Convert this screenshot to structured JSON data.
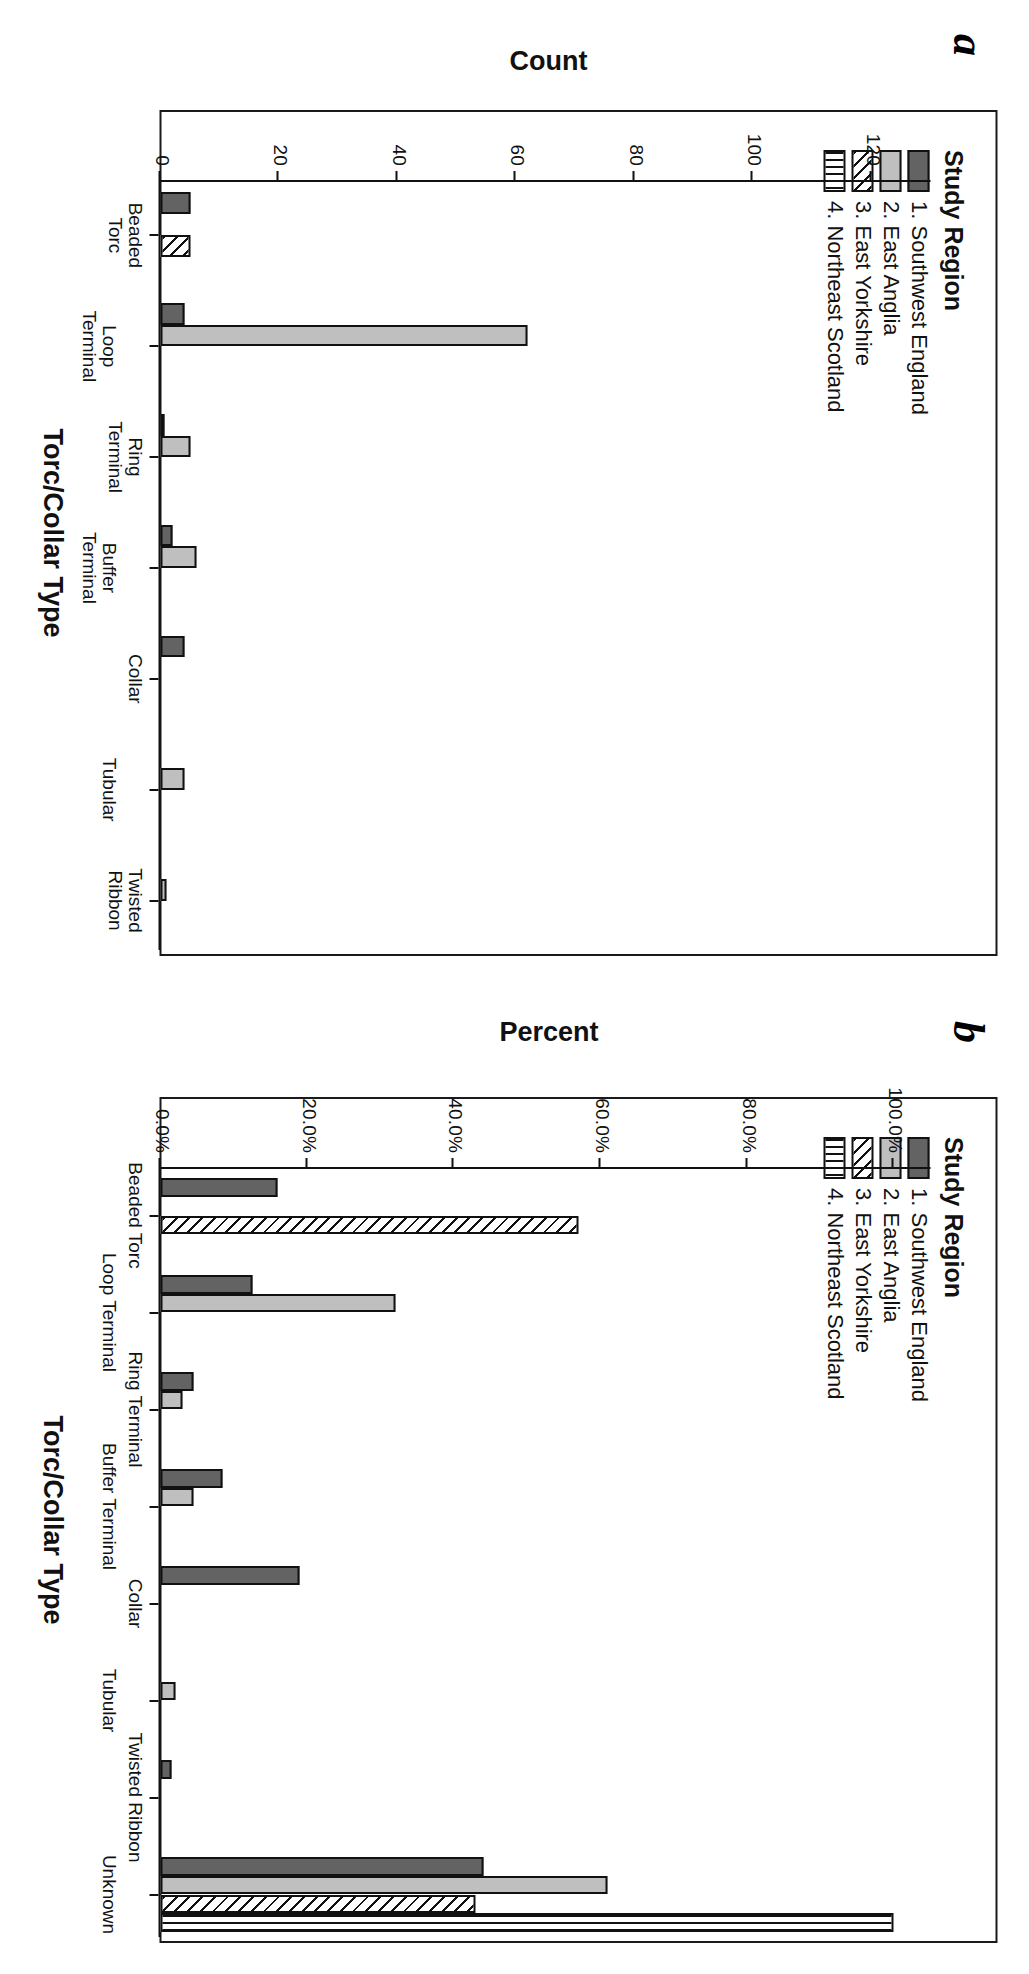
{
  "figure": {
    "panel_a_letter": "a",
    "panel_b_letter": "b"
  },
  "legend": {
    "title": "Study Region",
    "items": [
      {
        "label": "1. Southwest England",
        "pattern": "solid-dark-gray",
        "color": "#636363"
      },
      {
        "label": "2. East Anglia",
        "pattern": "solid-light-gray",
        "color": "#bfbfbf"
      },
      {
        "label": "3. East Yorkshire",
        "pattern": "diagonal-hatch",
        "color": "#ffffff"
      },
      {
        "label": "4. Northeast Scotland",
        "pattern": "vertical-hatch",
        "color": "#ffffff"
      }
    ]
  },
  "chart_data": [
    {
      "type": "bar",
      "panel": "a",
      "title": "",
      "xlabel": "Torc/Collar Type",
      "ylabel": "Count",
      "ylim": [
        0,
        130
      ],
      "yticks": [
        "0",
        "20",
        "40",
        "60",
        "80",
        "100",
        "120"
      ],
      "ytick_values": [
        0,
        20,
        40,
        60,
        80,
        100,
        120
      ],
      "grid": false,
      "legend_position": "top-left",
      "categories": [
        "Beaded Torc",
        "Loop Terminal",
        "Ring Terminal",
        "Buffer Terminal",
        "Collar",
        "Tubular",
        "Twisted Ribbon"
      ],
      "category_lines": [
        [
          "Beaded",
          "Torc"
        ],
        [
          "Loop",
          "Terminal"
        ],
        [
          "Ring",
          "Terminal"
        ],
        [
          "Buffer",
          "Terminal"
        ],
        [
          "Collar"
        ],
        [
          "Tubular"
        ],
        [
          "Twisted",
          "Ribbon"
        ]
      ],
      "series": [
        {
          "name": "1. Southwest England",
          "values": [
            5,
            4,
            0.5,
            2,
            4,
            0,
            0
          ]
        },
        {
          "name": "2. East Anglia",
          "values": [
            0,
            62,
            5,
            6,
            0,
            4,
            1
          ]
        },
        {
          "name": "3. East Yorkshire",
          "values": [
            5,
            0,
            0,
            0,
            0,
            0,
            0
          ]
        },
        {
          "name": "4. Northeast Scotland",
          "values": [
            0,
            0,
            0,
            0,
            0,
            0,
            0
          ]
        }
      ]
    },
    {
      "type": "bar",
      "panel": "b",
      "title": "",
      "xlabel": "Torc/Collar Type",
      "ylabel": "Percent",
      "ylim": [
        0,
        105
      ],
      "yticks": [
        "0.0%",
        "20.0%",
        "40.0%",
        "60.0%",
        "80.0%",
        "100.0%"
      ],
      "ytick_values": [
        0,
        20,
        40,
        60,
        80,
        100
      ],
      "grid": false,
      "legend_position": "top-left",
      "categories": [
        "Beaded Torc",
        "Loop Terminal",
        "Ring Terminal",
        "Buffer Terminal",
        "Collar",
        "Tubular",
        "Twisted Ribbon",
        "Unknown"
      ],
      "category_lines": [
        [
          "Beaded Torc"
        ],
        [
          "Loop Terminal"
        ],
        [
          "Ring Terminal"
        ],
        [
          "Buffer Terminal"
        ],
        [
          "Collar"
        ],
        [
          "Tubular"
        ],
        [
          "Twisted Ribbon"
        ],
        [
          "Unknown"
        ]
      ],
      "series": [
        {
          "name": "1. Southwest England",
          "values": [
            16.0,
            12.5,
            4.5,
            8.5,
            19.0,
            0,
            1.5,
            44.0
          ]
        },
        {
          "name": "2. East Anglia",
          "values": [
            0,
            32.0,
            3.0,
            4.5,
            0,
            2.0,
            0,
            61.0
          ]
        },
        {
          "name": "3. East Yorkshire",
          "values": [
            57.0,
            0,
            0,
            0,
            0,
            0,
            0,
            43.0
          ]
        },
        {
          "name": "4. Northeast Scotland",
          "values": [
            0,
            0,
            0,
            0,
            0,
            0,
            0,
            100.0
          ]
        }
      ]
    }
  ]
}
